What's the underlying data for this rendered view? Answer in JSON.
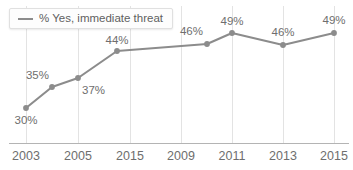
{
  "chart_data": {
    "type": "line",
    "title": "",
    "xlabel": "",
    "ylabel": "",
    "grid": "vertical",
    "legend_position": "top-left",
    "categories": [
      "2003",
      "2004",
      "2005",
      "2006",
      "2010",
      "2011",
      "2013",
      "2015"
    ],
    "tick_labels": [
      "2003",
      "2005",
      "2015",
      "2009",
      "2011",
      "2013",
      "2015"
    ],
    "series": [
      {
        "name": "% Yes, immediate threat",
        "color": "#8c8c8c",
        "values": [
          30,
          35,
          37,
          44,
          46,
          49,
          46,
          49
        ],
        "point_labels": [
          "30%",
          "35%",
          "37%",
          "44%",
          "46%",
          "49%",
          "46%",
          "49%"
        ]
      }
    ],
    "ylim": [
      22,
      54
    ],
    "value_suffix": "%"
  },
  "legend": {
    "label": "% Yes, immediate threat",
    "swatch_name": "line-swatch"
  },
  "axis": {
    "ticks": [
      {
        "label": "2003",
        "x": 26
      },
      {
        "label": "2005",
        "x": 78
      },
      {
        "label": "2015",
        "x": 130
      },
      {
        "label": "2009",
        "x": 181
      },
      {
        "label": "2011",
        "x": 232
      },
      {
        "label": "2013",
        "x": 283
      },
      {
        "label": "2015",
        "x": 334
      }
    ]
  },
  "points": [
    {
      "label": "30%",
      "value": 30,
      "x": 26,
      "y": 108,
      "lx": 26,
      "ly": 124,
      "anchor": "middle"
    },
    {
      "label": "35%",
      "value": 35,
      "x": 52,
      "y": 87,
      "lx": 49,
      "ly": 79,
      "anchor": "end"
    },
    {
      "label": "37%",
      "value": 37,
      "x": 78,
      "y": 78,
      "lx": 82,
      "ly": 94,
      "anchor": "start"
    },
    {
      "label": "44%",
      "value": 44,
      "x": 117,
      "y": 51,
      "lx": 117,
      "ly": 44,
      "anchor": "middle"
    },
    {
      "label": "46%",
      "value": 46,
      "x": 207,
      "y": 44,
      "lx": 203,
      "ly": 35,
      "anchor": "end"
    },
    {
      "label": "49%",
      "value": 49,
      "x": 232,
      "y": 33,
      "lx": 232,
      "ly": 25,
      "anchor": "middle"
    },
    {
      "label": "46%",
      "value": 46,
      "x": 283,
      "y": 45,
      "lx": 283,
      "ly": 36,
      "anchor": "middle"
    },
    {
      "label": "49%",
      "value": 49,
      "x": 334,
      "y": 33,
      "lx": 334,
      "ly": 24,
      "anchor": "middle"
    }
  ],
  "colors": {
    "series": "#8c8c8c",
    "gridline": "#e3e3e3",
    "axis": "#b4b4b4",
    "text": "#6e6e6e"
  }
}
